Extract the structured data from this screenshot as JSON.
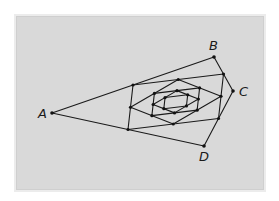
{
  "diagram": {
    "type": "nested-midpoint-quadrilaterals",
    "colors": {
      "background": "#d9d9d9",
      "frame": "#ececec",
      "line": "#1a1a1a",
      "point": "#111111"
    },
    "outer_quad": {
      "A": {
        "label": "A",
        "x": 52,
        "y": 113,
        "label_x": 38,
        "label_y": 118
      },
      "B": {
        "label": "B",
        "x": 214,
        "y": 57,
        "label_x": 209,
        "label_y": 50
      },
      "C": {
        "label": "C",
        "x": 233,
        "y": 91,
        "label_x": 239,
        "label_y": 96
      },
      "D": {
        "label": "D",
        "x": 204,
        "y": 146,
        "label_x": 199,
        "label_y": 161
      }
    },
    "levels": 6
  }
}
